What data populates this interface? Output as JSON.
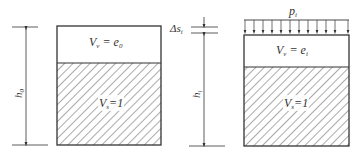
{
  "diagram": {
    "type": "soil-compression-phase-diagram",
    "colors": {
      "line": "#333333",
      "hatch": "#555555",
      "background": "#ffffff"
    },
    "left": {
      "height_label": "h",
      "height_sub": "0",
      "void_label": "V",
      "void_sub": "v",
      "void_eq": " = e",
      "void_eq_sub": "0",
      "solid_label": "V",
      "solid_sub": "s",
      "solid_eq": "=1"
    },
    "right": {
      "settlement_label": "Δs",
      "settlement_sub": "i",
      "height_label": "h",
      "height_sub": "i",
      "load_label": "p",
      "load_sub": "i",
      "void_label": "V",
      "void_sub": "v",
      "void_eq": " = e",
      "void_eq_sub": "i",
      "solid_label": "V",
      "solid_sub": "s",
      "solid_eq": "=1"
    }
  }
}
